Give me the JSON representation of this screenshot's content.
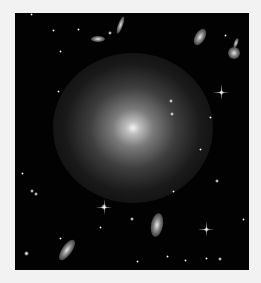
{
  "image": {
    "subject": "elliptical galaxy field",
    "background_color": "#020202",
    "frame": {
      "left": 15,
      "top": 13,
      "width": 234,
      "height": 257
    },
    "main_galaxy": {
      "cx": 118,
      "cy": 115,
      "rx": 80,
      "ry": 75,
      "core_color": "#f4f4f4"
    },
    "galaxies": [
      {
        "cx": 105,
        "cy": 12,
        "rx": 2.5,
        "ry": 9,
        "rot": 20
      },
      {
        "cx": 83,
        "cy": 26,
        "rx": 7,
        "ry": 3,
        "rot": 0
      },
      {
        "cx": 185,
        "cy": 24,
        "rx": 5,
        "ry": 9,
        "rot": 30
      },
      {
        "cx": 219,
        "cy": 40,
        "rx": 6,
        "ry": 6,
        "rot": 0
      },
      {
        "cx": 221,
        "cy": 30,
        "rx": 2,
        "ry": 5,
        "rot": 20
      },
      {
        "cx": 52,
        "cy": 237,
        "rx": 5,
        "ry": 12,
        "rot": 35
      },
      {
        "cx": 142,
        "cy": 212,
        "rx": 6,
        "ry": 12,
        "rot": 10
      }
    ],
    "stars": [
      {
        "x": 16,
        "y": 1,
        "s": 3
      },
      {
        "x": 38,
        "y": 17,
        "s": 3
      },
      {
        "x": 63,
        "y": 16,
        "s": 3
      },
      {
        "x": 95,
        "y": 20,
        "s": 4
      },
      {
        "x": 45,
        "y": 38,
        "s": 3
      },
      {
        "x": 210,
        "y": 22,
        "s": 3
      },
      {
        "x": 43,
        "y": 78,
        "s": 3
      },
      {
        "x": 206,
        "y": 79,
        "s": 5,
        "spike": true
      },
      {
        "x": 156,
        "y": 88,
        "s": 4
      },
      {
        "x": 157,
        "y": 101,
        "s": 4
      },
      {
        "x": 195,
        "y": 104,
        "s": 3
      },
      {
        "x": 185,
        "y": 136,
        "s": 3
      },
      {
        "x": 7,
        "y": 160,
        "s": 3
      },
      {
        "x": 17,
        "y": 178,
        "s": 4
      },
      {
        "x": 21,
        "y": 181,
        "s": 4
      },
      {
        "x": 202,
        "y": 168,
        "s": 4
      },
      {
        "x": 158,
        "y": 178,
        "s": 3
      },
      {
        "x": 89,
        "y": 194,
        "s": 6,
        "spike": true
      },
      {
        "x": 117,
        "y": 206,
        "s": 4
      },
      {
        "x": 85,
        "y": 214,
        "s": 3
      },
      {
        "x": 191,
        "y": 216,
        "s": 5,
        "spike": true
      },
      {
        "x": 228,
        "y": 206,
        "s": 3
      },
      {
        "x": 45,
        "y": 225,
        "s": 3
      },
      {
        "x": 11,
        "y": 240,
        "s": 5
      },
      {
        "x": 152,
        "y": 243,
        "s": 3
      },
      {
        "x": 191,
        "y": 245,
        "s": 3
      },
      {
        "x": 205,
        "y": 246,
        "s": 4
      },
      {
        "x": 122,
        "y": 248,
        "s": 3
      },
      {
        "x": 170,
        "y": 247,
        "s": 3
      }
    ]
  }
}
